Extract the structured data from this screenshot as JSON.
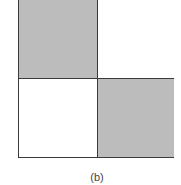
{
  "figure": {
    "label": "(b)",
    "grid": {
      "rows": 2,
      "cols": 2,
      "cells": [
        {
          "position": "top-left",
          "fill": "#bcbcbc",
          "shaded": true
        },
        {
          "position": "top-right",
          "fill": "#ffffff",
          "shaded": false
        },
        {
          "position": "bottom-left",
          "fill": "#ffffff",
          "shaded": false
        },
        {
          "position": "bottom-right",
          "fill": "#bcbcbc",
          "shaded": true
        }
      ],
      "line_color": "#3a3a3a"
    }
  }
}
